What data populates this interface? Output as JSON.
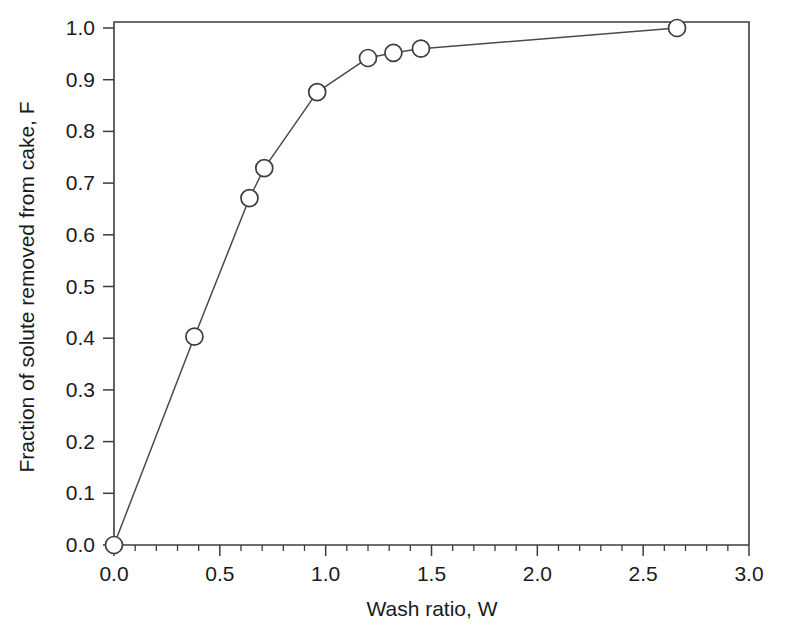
{
  "chart_data": {
    "type": "line",
    "title": "",
    "subtitle": "",
    "xlabel": "Wash ratio, W",
    "ylabel": "Fraction of solute removed from cake, F",
    "xlim": [
      0.0,
      3.0
    ],
    "ylim": [
      0.0,
      1.0
    ],
    "grid": false,
    "legend": null,
    "legend_position": "none",
    "marker": "open-circle",
    "line_style": "solid",
    "series": [
      {
        "name": "Wash curve",
        "x": [
          0.0,
          0.38,
          0.64,
          0.71,
          0.96,
          1.2,
          1.32,
          1.45,
          2.66
        ],
        "y": [
          0.0,
          0.403,
          0.671,
          0.729,
          0.876,
          0.942,
          0.952,
          0.96,
          1.0
        ]
      }
    ],
    "x_ticks": [
      {
        "value": 0.0,
        "label": "0.0"
      },
      {
        "value": 0.5,
        "label": "0.5"
      },
      {
        "value": 1.0,
        "label": "1.0"
      },
      {
        "value": 1.5,
        "label": "1.5"
      },
      {
        "value": 2.0,
        "label": "2.0"
      },
      {
        "value": 2.5,
        "label": "2.5"
      },
      {
        "value": 3.0,
        "label": "3.0"
      }
    ],
    "x_minor_tick_count_between_majors": 4,
    "y_ticks": [
      {
        "value": 0.0,
        "label": "0.0"
      },
      {
        "value": 0.1,
        "label": "0.1"
      },
      {
        "value": 0.2,
        "label": "0.2"
      },
      {
        "value": 0.3,
        "label": "0.3"
      },
      {
        "value": 0.4,
        "label": "0.4"
      },
      {
        "value": 0.5,
        "label": "0.5"
      },
      {
        "value": 0.6,
        "label": "0.6"
      },
      {
        "value": 0.7,
        "label": "0.7"
      },
      {
        "value": 0.8,
        "label": "0.8"
      },
      {
        "value": 0.9,
        "label": "0.9"
      },
      {
        "value": 1.0,
        "label": "1.0"
      }
    ],
    "y_minor_tick_count_between_majors": 0,
    "colors": {
      "background": "#ffffff",
      "axis": "#3c3c3c",
      "line": "#4a4a4a",
      "marker_fill": "#ffffff",
      "marker_stroke": "#3c3c3c",
      "text": "#1a1a1a"
    }
  }
}
